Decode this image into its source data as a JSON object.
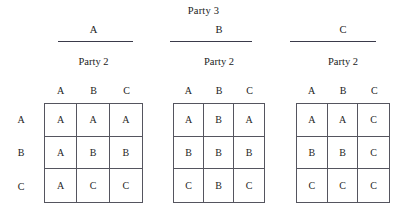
{
  "figure": {
    "title": "Party 3",
    "row_axis_label": "Party 2",
    "row_labels": [
      "A",
      "B",
      "C"
    ],
    "column_headers": [
      "A",
      "B",
      "C"
    ],
    "blocks": [
      {
        "party3_strategy": "A",
        "party2_label": "Party 2",
        "col_headers": [
          "A",
          "B",
          "C"
        ],
        "rows": [
          {
            "label": "A",
            "cells": [
              "A",
              "A",
              "A"
            ]
          },
          {
            "label": "B",
            "cells": [
              "A",
              "B",
              "B"
            ]
          },
          {
            "label": "C",
            "cells": [
              "A",
              "C",
              "C"
            ]
          }
        ]
      },
      {
        "party3_strategy": "B",
        "party2_label": "Party 2",
        "col_headers": [
          "A",
          "B",
          "C"
        ],
        "rows": [
          {
            "label": "A",
            "cells": [
              "A",
              "B",
              "A"
            ]
          },
          {
            "label": "B",
            "cells": [
              "B",
              "B",
              "B"
            ]
          },
          {
            "label": "C",
            "cells": [
              "C",
              "B",
              "C"
            ]
          }
        ]
      },
      {
        "party3_strategy": "C",
        "party2_label": "Party 2",
        "col_headers": [
          "A",
          "B",
          "C"
        ],
        "rows": [
          {
            "label": "A",
            "cells": [
              "A",
              "A",
              "C"
            ]
          },
          {
            "label": "B",
            "cells": [
              "B",
              "B",
              "C"
            ]
          },
          {
            "label": "C",
            "cells": [
              "C",
              "C",
              "C"
            ]
          }
        ]
      }
    ]
  }
}
